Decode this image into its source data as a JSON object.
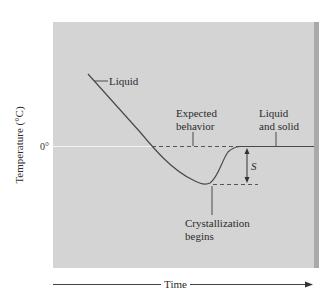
{
  "figure": {
    "y_axis_label": "Temperature (°C)",
    "x_axis_label": "Time",
    "zero_tick": "0°",
    "labels": {
      "liquid": "Liquid",
      "expected_line1": "Expected",
      "expected_line2": "behavior",
      "liquid_solid_line1": "Liquid",
      "liquid_solid_line2": "and solid",
      "supercooling": "S",
      "crystallization_line1": "Crystallization",
      "crystallization_line2": "begins"
    },
    "colors": {
      "panel": "#d4d4d4",
      "panel_shadow": "#a9a9a9",
      "curve": "#4a4a4a",
      "zero_line": "#f4f4f4"
    }
  }
}
